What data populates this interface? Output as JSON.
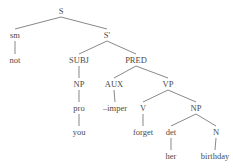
{
  "diagram": {
    "type": "syntax-tree",
    "nodes": [
      {
        "id": "S",
        "label": "S",
        "x": 61,
        "y": 14
      },
      {
        "id": "sm",
        "label": "sm",
        "x": 15,
        "y": 38
      },
      {
        "id": "not",
        "label": "not",
        "x": 15,
        "y": 63
      },
      {
        "id": "S1",
        "label": "S'",
        "x": 107,
        "y": 38
      },
      {
        "id": "SUBJ",
        "label": "SUBJ",
        "x": 79,
        "y": 63
      },
      {
        "id": "NP1",
        "label": "NP",
        "x": 79,
        "y": 87
      },
      {
        "id": "pro",
        "label": "pro",
        "x": 79,
        "y": 111
      },
      {
        "id": "you",
        "label": "you",
        "x": 79,
        "y": 135
      },
      {
        "id": "PRED",
        "label": "PRED",
        "x": 136,
        "y": 63
      },
      {
        "id": "AUX",
        "label": "AUX",
        "x": 114,
        "y": 87
      },
      {
        "id": "imper",
        "label": "–imper",
        "x": 115,
        "y": 111
      },
      {
        "id": "VP",
        "label": "VP",
        "x": 168,
        "y": 87
      },
      {
        "id": "V",
        "label": "V",
        "x": 143,
        "y": 111
      },
      {
        "id": "forget",
        "label": "forget",
        "x": 143,
        "y": 135
      },
      {
        "id": "NP2",
        "label": "NP",
        "x": 196,
        "y": 111
      },
      {
        "id": "det",
        "label": "det",
        "x": 171,
        "y": 135
      },
      {
        "id": "her",
        "label": "her",
        "x": 171,
        "y": 159
      },
      {
        "id": "N",
        "label": "N",
        "x": 216,
        "y": 135
      },
      {
        "id": "birthday",
        "label": "birthday",
        "x": 215,
        "y": 159
      }
    ],
    "edges": [
      [
        "S",
        "sm"
      ],
      [
        "S",
        "S1"
      ],
      [
        "sm",
        "not"
      ],
      [
        "S1",
        "SUBJ"
      ],
      [
        "S1",
        "PRED"
      ],
      [
        "SUBJ",
        "NP1"
      ],
      [
        "NP1",
        "pro"
      ],
      [
        "pro",
        "you"
      ],
      [
        "PRED",
        "AUX"
      ],
      [
        "PRED",
        "VP"
      ],
      [
        "AUX",
        "imper"
      ],
      [
        "VP",
        "V"
      ],
      [
        "VP",
        "NP2"
      ],
      [
        "V",
        "forget"
      ],
      [
        "NP2",
        "det"
      ],
      [
        "NP2",
        "N"
      ],
      [
        "det",
        "her"
      ],
      [
        "N",
        "birthday"
      ]
    ]
  }
}
